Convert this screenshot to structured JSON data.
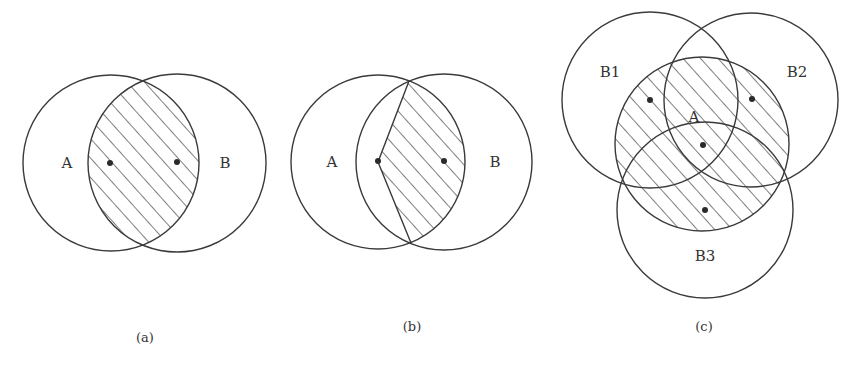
{
  "figure": {
    "style": {
      "stroke_color": "#3a3a3a",
      "dot_color": "#2a2a2a",
      "label_color": "#333333",
      "background": "#ffffff",
      "hatch_angle_deg": -45
    },
    "panels": [
      {
        "id": "a",
        "caption": "(a)",
        "description": "Two overlapping circles A and B; intersection lens is hatched; center dots lie inside lens",
        "circles": [
          {
            "name": "A",
            "label": "A",
            "cx": 111,
            "cy": 163,
            "r": 88
          },
          {
            "name": "B",
            "label": "B",
            "cx": 177,
            "cy": 163,
            "r": 89
          }
        ],
        "labels": [
          {
            "text": "A",
            "x": 67,
            "y": 168
          },
          {
            "text": "B",
            "x": 225,
            "y": 168
          }
        ],
        "dots": [
          {
            "x": 110,
            "y": 163
          },
          {
            "x": 177,
            "y": 162
          }
        ],
        "hatched_region": "A ∩ B"
      },
      {
        "id": "b",
        "caption": "(b)",
        "description": "Two overlapping circles A and B; region of B∩A right of polyline through A's center is hatched",
        "circles": [
          {
            "name": "A",
            "label": "A",
            "cx": 378,
            "cy": 162,
            "r": 87
          },
          {
            "name": "B",
            "label": "B",
            "cx": 444,
            "cy": 162,
            "r": 88
          }
        ],
        "labels": [
          {
            "text": "A",
            "x": 332,
            "y": 167
          },
          {
            "text": "B",
            "x": 495,
            "y": 167
          }
        ],
        "dots": [
          {
            "x": 378,
            "y": 161
          },
          {
            "x": 444,
            "y": 161
          }
        ],
        "hatched_region": "A ∩ B bounded on left by segments from intersection points to center of A"
      },
      {
        "id": "c",
        "caption": "(c)",
        "description": "Central circle A hatched, overlapped by three circles B1, B2, B3",
        "circles": [
          {
            "name": "A",
            "label": "A",
            "cx": 702,
            "cy": 144,
            "r": 87
          },
          {
            "name": "B1",
            "label": "B1",
            "cx": 650,
            "cy": 100,
            "r": 88
          },
          {
            "name": "B2",
            "label": "B2",
            "cx": 751,
            "cy": 100,
            "r": 87
          },
          {
            "name": "B3",
            "label": "B3",
            "cx": 705,
            "cy": 210,
            "r": 88
          }
        ],
        "labels": [
          {
            "text": "B1",
            "x": 610,
            "y": 77
          },
          {
            "text": "B2",
            "x": 797,
            "y": 77
          },
          {
            "text": "A",
            "x": 694,
            "y": 122
          },
          {
            "text": "B3",
            "x": 705,
            "y": 261
          }
        ],
        "dots": [
          {
            "x": 650,
            "y": 100
          },
          {
            "x": 752,
            "y": 99
          },
          {
            "x": 703,
            "y": 145
          },
          {
            "x": 705,
            "y": 210
          }
        ],
        "hatched_region": "A"
      }
    ],
    "captions": [
      {
        "text": "(a)",
        "x": 145,
        "y": 342
      },
      {
        "text": "(b)",
        "x": 412,
        "y": 331
      },
      {
        "text": "(c)",
        "x": 704,
        "y": 331
      }
    ]
  }
}
